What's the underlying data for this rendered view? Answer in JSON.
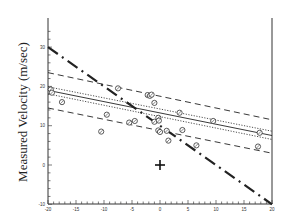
{
  "chart_data": {
    "type": "scatter",
    "title": "",
    "xlabel": "",
    "ylabel": "Measured Velocity (m/sec)",
    "xlim": [
      -20,
      20
    ],
    "ylim": [
      -10,
      35
    ],
    "x_ticks": [
      -20,
      -15,
      -10,
      -5,
      0,
      5,
      10,
      15,
      20
    ],
    "y_ticks": [
      -10,
      0,
      10,
      20,
      30
    ],
    "grid": false,
    "legend": null,
    "points": [
      {
        "x": -19.5,
        "y": 19.2
      },
      {
        "x": -19.3,
        "y": 18.4
      },
      {
        "x": -17.5,
        "y": 16.0
      },
      {
        "x": -10.5,
        "y": 8.5
      },
      {
        "x": -9.5,
        "y": 12.8
      },
      {
        "x": -7.5,
        "y": 19.5
      },
      {
        "x": -5.5,
        "y": 10.8
      },
      {
        "x": -4.5,
        "y": 11.2
      },
      {
        "x": -2.2,
        "y": 17.8
      },
      {
        "x": -1.8,
        "y": 17.6
      },
      {
        "x": -1.5,
        "y": 17.9
      },
      {
        "x": -1.0,
        "y": 15.8
      },
      {
        "x": -1.0,
        "y": 11.0
      },
      {
        "x": -0.3,
        "y": 12.0
      },
      {
        "x": -0.2,
        "y": 11.3
      },
      {
        "x": -0.3,
        "y": 8.8
      },
      {
        "x": 0.0,
        "y": 8.4
      },
      {
        "x": 1.2,
        "y": 8.7
      },
      {
        "x": 1.5,
        "y": 6.2
      },
      {
        "x": 3.5,
        "y": 13.3
      },
      {
        "x": 4.0,
        "y": 8.9
      },
      {
        "x": 9.5,
        "y": 11.2
      },
      {
        "x": 17.8,
        "y": 8.2
      },
      {
        "x": 6.5,
        "y": 5.0
      },
      {
        "x": 17.5,
        "y": 4.7
      }
    ],
    "outlier_marker": {
      "x": 0.0,
      "y": 0.0,
      "symbol": "+"
    },
    "lines": [
      {
        "name": "regression",
        "style": "solid",
        "x": [
          -20,
          20
        ],
        "y": [
          19.0,
          7.5
        ]
      },
      {
        "name": "confidence-upper",
        "style": "dotted",
        "x": [
          -20,
          20
        ],
        "y": [
          19.9,
          8.6
        ]
      },
      {
        "name": "confidence-lower",
        "style": "dotted",
        "x": [
          -20,
          20
        ],
        "y": [
          18.1,
          6.5
        ]
      },
      {
        "name": "prediction-upper",
        "style": "dashed",
        "x": [
          -20,
          20
        ],
        "y": [
          23.5,
          11.5
        ]
      },
      {
        "name": "prediction-lower",
        "style": "dashed",
        "x": [
          -20,
          20
        ],
        "y": [
          14.5,
          3.0
        ]
      },
      {
        "name": "identity",
        "style": "dash-dot",
        "x": [
          -20,
          20
        ],
        "y": [
          30.0,
          -10.0
        ]
      }
    ]
  }
}
